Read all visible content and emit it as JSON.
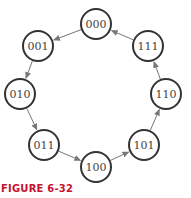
{
  "diagram": {
    "type": "state-diagram",
    "states": [
      {
        "label": "000",
        "cx": 96,
        "cy": 24
      },
      {
        "label": "001",
        "cx": 38,
        "cy": 46
      },
      {
        "label": "010",
        "cx": 20,
        "cy": 94
      },
      {
        "label": "011",
        "cx": 44,
        "cy": 145
      },
      {
        "label": "100",
        "cx": 96,
        "cy": 167
      },
      {
        "label": "101",
        "cx": 144,
        "cy": 145
      },
      {
        "label": "110",
        "cx": 166,
        "cy": 94
      },
      {
        "label": "111",
        "cx": 148,
        "cy": 46
      }
    ],
    "transitions": [
      {
        "from": "000",
        "to": "001"
      },
      {
        "from": "001",
        "to": "010"
      },
      {
        "from": "010",
        "to": "011"
      },
      {
        "from": "011",
        "to": "100"
      },
      {
        "from": "100",
        "to": "101"
      },
      {
        "from": "101",
        "to": "110"
      },
      {
        "from": "110",
        "to": "111"
      },
      {
        "from": "111",
        "to": "000"
      }
    ],
    "radius": 15,
    "colors": {
      "circle": "#333333",
      "arrow": "#777777",
      "caption": "#c8102e"
    }
  },
  "caption": "FIGURE 6-32"
}
